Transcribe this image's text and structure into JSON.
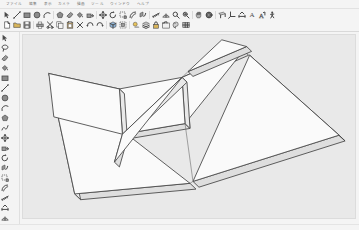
{
  "window": {
    "title": "SketchUp",
    "canvas_bg": "#e9e9e9",
    "chrome_bg": "#f4f4f4"
  },
  "menubar": {
    "items": [
      {
        "label": "ファイル",
        "name": "menu-file"
      },
      {
        "label": "編集",
        "name": "menu-edit"
      },
      {
        "label": "表示",
        "name": "menu-view"
      },
      {
        "label": "カメラ",
        "name": "menu-camera"
      },
      {
        "label": "描画",
        "name": "menu-draw"
      },
      {
        "label": "ツール",
        "name": "menu-tools"
      },
      {
        "label": "ウィンドウ",
        "name": "menu-window"
      },
      {
        "label": "ヘルプ",
        "name": "menu-help"
      }
    ]
  },
  "toolbar_row1": {
    "items": [
      {
        "name": "select-tool-button",
        "icon": "arrow-cursor-icon",
        "tip": "Select"
      },
      {
        "name": "line-tool-button",
        "icon": "line-icon",
        "tip": "Line"
      },
      {
        "name": "rectangle-tool-button",
        "icon": "rectangle-icon",
        "tip": "Rectangle"
      },
      {
        "name": "circle-tool-button",
        "icon": "circle-icon",
        "tip": "Circle"
      },
      {
        "name": "arc-tool-button",
        "icon": "arc-icon",
        "tip": "Arc"
      },
      {
        "name": "separator-1",
        "icon": "separator",
        "tip": ""
      },
      {
        "name": "polygon-tool-button",
        "icon": "polygon-icon",
        "tip": "Polygon"
      },
      {
        "name": "eraser-tool-button",
        "icon": "eraser-icon",
        "tip": "Eraser"
      },
      {
        "name": "paint-bucket-button",
        "icon": "paint-bucket-icon",
        "tip": "Paint Bucket"
      },
      {
        "name": "push-pull-button",
        "icon": "push-pull-icon",
        "tip": "Push/Pull"
      },
      {
        "name": "separator-2",
        "icon": "separator",
        "tip": ""
      },
      {
        "name": "move-tool-button",
        "icon": "move-icon",
        "tip": "Move"
      },
      {
        "name": "rotate-tool-button",
        "icon": "rotate-icon",
        "tip": "Rotate"
      },
      {
        "name": "scale-tool-button",
        "icon": "scale-icon",
        "tip": "Scale"
      },
      {
        "name": "offset-tool-button",
        "icon": "offset-icon",
        "tip": "Offset"
      },
      {
        "name": "followme-tool-button",
        "icon": "follow-me-icon",
        "tip": "Follow Me"
      },
      {
        "name": "separator-3",
        "icon": "separator",
        "tip": ""
      },
      {
        "name": "tape-measure-button",
        "icon": "tape-measure-icon",
        "tip": "Tape Measure"
      },
      {
        "name": "protractor-button",
        "icon": "protractor-icon",
        "tip": "Protractor"
      },
      {
        "name": "zoom-tool-button",
        "icon": "magnifier-icon",
        "tip": "Zoom"
      },
      {
        "name": "zoom-extents-button",
        "icon": "zoom-extents-icon",
        "tip": "Zoom Extents"
      },
      {
        "name": "separator-4",
        "icon": "separator",
        "tip": ""
      },
      {
        "name": "pan-tool-button",
        "icon": "pan-hand-icon",
        "tip": "Pan"
      },
      {
        "name": "orbit-tool-button",
        "icon": "orbit-icon",
        "tip": "Orbit"
      },
      {
        "name": "separator-5",
        "icon": "separator",
        "tip": ""
      },
      {
        "name": "section-plane-button",
        "icon": "section-plane-icon",
        "tip": "Section Plane"
      },
      {
        "name": "axes-tool-button",
        "icon": "axes-icon",
        "tip": "Axes"
      },
      {
        "name": "dimension-tool-button",
        "icon": "dimension-icon",
        "tip": "Dimension"
      },
      {
        "name": "text-tool-button",
        "icon": "text-icon",
        "tip": "Text"
      },
      {
        "name": "threedtext-button",
        "icon": "three-d-text-icon",
        "tip": "3D Text"
      },
      {
        "name": "walk-tool-button",
        "icon": "walk-icon",
        "tip": "Walk"
      }
    ]
  },
  "toolbar_row2": {
    "items": [
      {
        "name": "new-document-button",
        "icon": "new-document-icon",
        "tip": "New"
      },
      {
        "name": "open-document-button",
        "icon": "open-folder-icon",
        "tip": "Open"
      },
      {
        "name": "save-document-button",
        "icon": "floppy-save-icon",
        "tip": "Save"
      },
      {
        "name": "separator-6",
        "icon": "separator",
        "tip": ""
      },
      {
        "name": "print-button",
        "icon": "printer-icon",
        "tip": "Print"
      },
      {
        "name": "cut-button",
        "icon": "scissors-icon",
        "tip": "Cut"
      },
      {
        "name": "copy-button",
        "icon": "copy-pages-icon",
        "tip": "Copy"
      },
      {
        "name": "paste-button",
        "icon": "clipboard-icon",
        "tip": "Paste"
      },
      {
        "name": "delete-button",
        "icon": "x-delete-icon",
        "tip": "Delete"
      },
      {
        "name": "undo-button",
        "icon": "undo-arrow-icon",
        "tip": "Undo"
      },
      {
        "name": "redo-button",
        "icon": "redo-arrow-icon",
        "tip": "Redo"
      },
      {
        "name": "separator-7",
        "icon": "separator",
        "tip": ""
      },
      {
        "name": "make-component-button",
        "icon": "component-icon",
        "tip": "Make Component"
      },
      {
        "name": "make-group-button",
        "icon": "group-icon",
        "tip": "Make Group"
      },
      {
        "name": "separator-8",
        "icon": "separator",
        "tip": ""
      },
      {
        "name": "shadow-settings-button",
        "icon": "shadow-icon",
        "tip": "Shadows"
      },
      {
        "name": "layers-button",
        "icon": "layers-icon",
        "tip": "Layers"
      },
      {
        "name": "lock-button",
        "icon": "lock-icon",
        "tip": "Lock"
      },
      {
        "name": "scene-tabs-button",
        "icon": "scenes-icon",
        "tip": "Scenes"
      },
      {
        "name": "styles-button",
        "icon": "styles-icon",
        "tip": "Styles"
      },
      {
        "name": "materials-button",
        "icon": "materials-icon",
        "tip": "Materials"
      }
    ]
  },
  "sidebar": {
    "items": [
      {
        "name": "sidebar-select-tool",
        "icon": "arrow-cursor-icon"
      },
      {
        "name": "sidebar-lasso-tool",
        "icon": "lasso-icon"
      },
      {
        "name": "sidebar-eraser-tool",
        "icon": "eraser-icon"
      },
      {
        "name": "sidebar-paint-tool",
        "icon": "paint-bucket-icon"
      },
      {
        "name": "sidebar-rectangle-tool",
        "icon": "rectangle-icon"
      },
      {
        "name": "sidebar-line-tool",
        "icon": "line-icon"
      },
      {
        "name": "sidebar-circle-tool",
        "icon": "circle-icon"
      },
      {
        "name": "sidebar-arc-tool",
        "icon": "arc-icon"
      },
      {
        "name": "sidebar-polygon-tool",
        "icon": "polygon-icon"
      },
      {
        "name": "sidebar-freehand-tool",
        "icon": "freehand-icon"
      },
      {
        "name": "sidebar-move-tool",
        "icon": "move-icon"
      },
      {
        "name": "sidebar-pushpull-tool",
        "icon": "push-pull-icon"
      },
      {
        "name": "sidebar-rotate-tool",
        "icon": "rotate-icon"
      },
      {
        "name": "sidebar-followme-tool",
        "icon": "follow-me-icon"
      },
      {
        "name": "sidebar-scale-tool",
        "icon": "scale-icon"
      },
      {
        "name": "sidebar-offset-tool",
        "icon": "offset-icon"
      },
      {
        "name": "sidebar-tape-tool",
        "icon": "tape-measure-icon"
      },
      {
        "name": "sidebar-dimension-tool",
        "icon": "dimension-icon"
      },
      {
        "name": "sidebar-protractor-tool",
        "icon": "protractor-icon"
      },
      {
        "name": "sidebar-text-tool",
        "icon": "text-icon"
      },
      {
        "name": "sidebar-axes-tool",
        "icon": "axes-icon"
      },
      {
        "name": "sidebar-threedtext-tool",
        "icon": "three-d-text-icon"
      },
      {
        "name": "sidebar-orbit-tool",
        "icon": "orbit-icon"
      },
      {
        "name": "sidebar-pan-tool",
        "icon": "pan-hand-icon"
      },
      {
        "name": "sidebar-zoom-tool",
        "icon": "magnifier-icon"
      },
      {
        "name": "sidebar-zoom-window-tool",
        "icon": "zoom-window-icon"
      },
      {
        "name": "sidebar-zoom-extents-tool",
        "icon": "zoom-extents-icon"
      },
      {
        "name": "sidebar-previous-view-tool",
        "icon": "previous-view-icon"
      },
      {
        "name": "sidebar-position-camera-tool",
        "icon": "position-camera-icon"
      },
      {
        "name": "sidebar-lookaround-tool",
        "icon": "look-around-icon"
      },
      {
        "name": "sidebar-walk-tool",
        "icon": "walk-icon"
      },
      {
        "name": "sidebar-section-tool",
        "icon": "section-plane-icon"
      }
    ]
  },
  "model": {
    "name": "tangram-puzzle-model",
    "description": "Seven flat extruded tangram pieces forming a square, viewed in perspective",
    "face_fill": "#f7f7f7",
    "side_fill": "#e0e0e0",
    "edge_color": "#4a4a4a",
    "pieces": [
      {
        "name": "large-triangle-left",
        "type": "large-triangle"
      },
      {
        "name": "large-triangle-right",
        "type": "large-triangle"
      },
      {
        "name": "medium-triangle",
        "type": "medium-triangle"
      },
      {
        "name": "small-triangle-upper",
        "type": "small-triangle"
      },
      {
        "name": "small-triangle-lower",
        "type": "small-triangle"
      },
      {
        "name": "square-piece",
        "type": "square"
      },
      {
        "name": "parallelogram-piece",
        "type": "parallelogram"
      }
    ]
  }
}
